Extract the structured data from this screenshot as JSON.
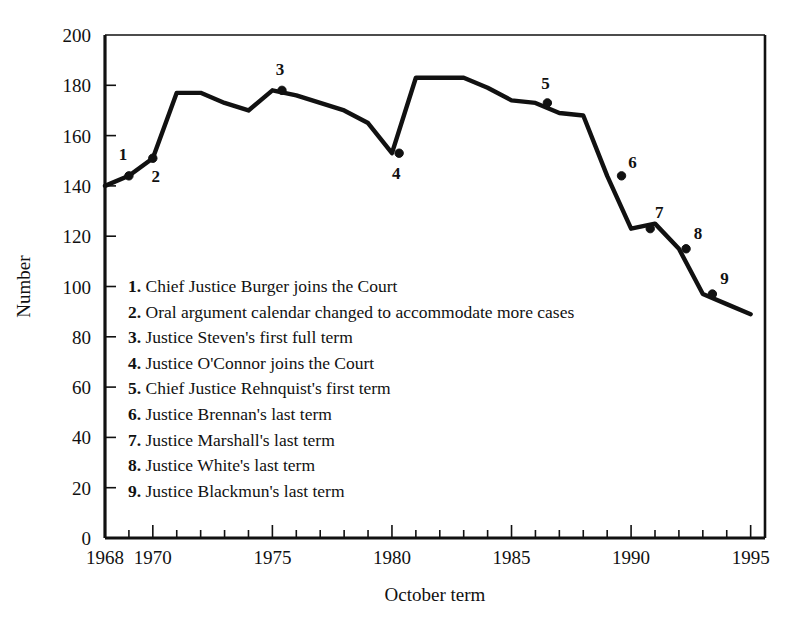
{
  "chart_data": {
    "type": "line",
    "title": "",
    "xlabel": "October term",
    "ylabel": "Number",
    "xlim": [
      1968,
      1995.6
    ],
    "ylim": [
      0,
      200
    ],
    "grid": false,
    "legend_position": "inside-center-left",
    "x_ticks_major": [
      1968,
      1970,
      1975,
      1980,
      1985,
      1990,
      1995
    ],
    "x_ticks_minor_step": 1,
    "y_ticks": [
      0,
      20,
      40,
      60,
      80,
      100,
      120,
      140,
      160,
      180,
      200
    ],
    "x": [
      1968,
      1969,
      1970,
      1971,
      1972,
      1973,
      1974,
      1975,
      1976,
      1977,
      1978,
      1979,
      1980,
      1981,
      1982,
      1983,
      1984,
      1985,
      1986,
      1987,
      1988,
      1989,
      1990,
      1991,
      1992,
      1993,
      1994,
      1995
    ],
    "values": [
      140,
      144,
      151,
      177,
      177,
      173,
      170,
      178,
      176,
      173,
      170,
      165,
      153,
      183,
      183,
      183,
      179,
      174,
      173,
      169,
      168,
      144,
      123,
      125,
      115,
      97,
      93,
      89
    ],
    "series": [
      {
        "name": "Number of cases",
        "values": [
          140,
          144,
          151,
          177,
          177,
          173,
          170,
          178,
          176,
          173,
          170,
          165,
          153,
          183,
          183,
          183,
          179,
          174,
          173,
          169,
          168,
          144,
          123,
          125,
          115,
          97,
          93,
          89
        ]
      }
    ],
    "annotations": [
      {
        "id": "1",
        "x": 1969.0,
        "y": 144,
        "label_dx": -6,
        "label_dy": -16
      },
      {
        "id": "2",
        "x": 1970.0,
        "y": 151,
        "label_dx": 3,
        "label_dy": 24
      },
      {
        "id": "3",
        "x": 1975.4,
        "y": 178,
        "label_dx": -2,
        "label_dy": -15
      },
      {
        "id": "4",
        "x": 1980.3,
        "y": 153,
        "label_dx": -3,
        "label_dy": 26
      },
      {
        "id": "5",
        "x": 1986.5,
        "y": 173,
        "label_dx": -2,
        "label_dy": -14
      },
      {
        "id": "6",
        "x": 1989.6,
        "y": 144,
        "label_dx": 11,
        "label_dy": -8
      },
      {
        "id": "7",
        "x": 1990.8,
        "y": 123,
        "label_dx": 9,
        "label_dy": -11
      },
      {
        "id": "8",
        "x": 1992.3,
        "y": 115,
        "label_dx": 12,
        "label_dy": -10
      },
      {
        "id": "9",
        "x": 1993.4,
        "y": 97,
        "label_dx": 12,
        "label_dy": -10
      }
    ]
  },
  "legend": {
    "items": [
      {
        "num": "1.",
        "text": "Chief Justice Burger joins the Court"
      },
      {
        "num": "2.",
        "text": "Oral argument calendar changed to accommodate more cases"
      },
      {
        "num": "3.",
        "text": "Justice Steven's first full term"
      },
      {
        "num": "4.",
        "text": "Justice O'Connor joins the Court"
      },
      {
        "num": "5.",
        "text": "Chief Justice Rehnquist's first term"
      },
      {
        "num": "6.",
        "text": "Justice Brennan's last term"
      },
      {
        "num": "7.",
        "text": "Justice Marshall's last term"
      },
      {
        "num": "8.",
        "text": "Justice White's last term"
      },
      {
        "num": "9.",
        "text": "Justice Blackmun's last term"
      }
    ]
  },
  "colors": {
    "line": "#111111",
    "axis": "#111111",
    "background": "#ffffff"
  }
}
